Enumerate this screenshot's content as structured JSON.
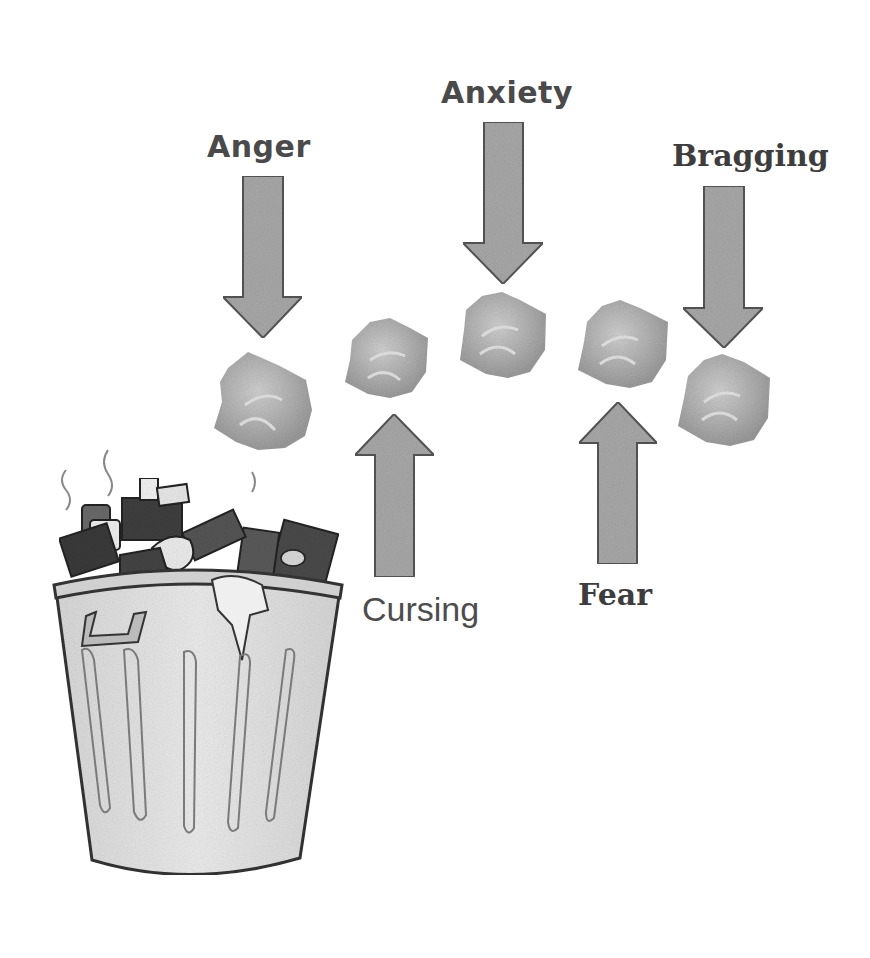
{
  "diagram": {
    "labels": {
      "anger": "Anger",
      "anxiety": "Anxiety",
      "bragging": "Bragging",
      "cursing": "Cursing",
      "fear": "Fear"
    },
    "arrows": [
      {
        "label": "Anger",
        "direction": "down"
      },
      {
        "label": "Anxiety",
        "direction": "down"
      },
      {
        "label": "Bragging",
        "direction": "down"
      },
      {
        "label": "Cursing",
        "direction": "up"
      },
      {
        "label": "Fear",
        "direction": "up"
      }
    ],
    "icons": {
      "trash_can": "trash-can-icon",
      "paper_ball": "crumpled-paper-icon",
      "arrow": "arrow-icon"
    },
    "colors": {
      "arrow_fill": "#a8a8a8",
      "arrow_stroke": "#555555",
      "paper": "#b5b5b5",
      "text": "#4a4a4a",
      "can_body": "#e4e4e4",
      "can_outline": "#3a3a3a"
    }
  }
}
